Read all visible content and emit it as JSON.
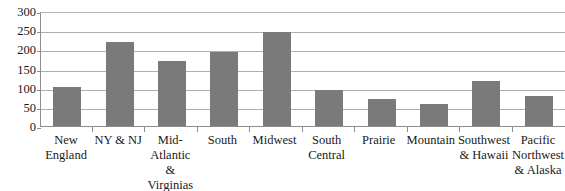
{
  "chart_data": {
    "type": "bar",
    "title": "",
    "xlabel": "",
    "ylabel": "",
    "ylim": [
      0,
      300
    ],
    "yticks": [
      0,
      50,
      100,
      150,
      200,
      250,
      300
    ],
    "grid": true,
    "legend": "none",
    "bar_color": "#7a7a7a",
    "gridline_color": "#b0b0b0",
    "axis_color": "#8e8e8e",
    "categories": [
      "New England",
      "NY & NJ",
      "Mid-Atlantic & Virginias",
      "South",
      "Midwest",
      "South Central",
      "Prairie",
      "Mountain",
      "Southwest & Hawaii",
      "Pacific Northwest & Alaska"
    ],
    "values": [
      103,
      220,
      170,
      192,
      245,
      95,
      70,
      57,
      118,
      78
    ]
  }
}
